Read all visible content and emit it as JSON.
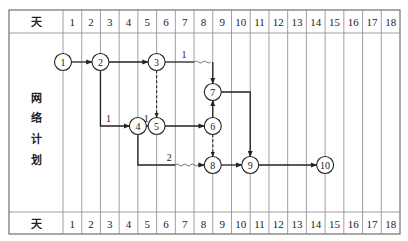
{
  "diagram": {
    "type": "time-scaled-network-plan",
    "header_label": "天",
    "footer_label": "天",
    "side_label_chars": [
      "网",
      "络",
      "计",
      "划"
    ],
    "days": [
      "1",
      "2",
      "3",
      "4",
      "5",
      "6",
      "7",
      "8",
      "9",
      "10",
      "11",
      "12",
      "13",
      "14",
      "15",
      "16",
      "17",
      "18"
    ],
    "nodes": [
      {
        "id": "1",
        "label": "1",
        "day": 0,
        "row": 0
      },
      {
        "id": "2",
        "label": "2",
        "day": 2,
        "row": 0
      },
      {
        "id": "3",
        "label": "3",
        "day": 5,
        "row": 0
      },
      {
        "id": "7",
        "label": "7",
        "day": 8,
        "row": 1
      },
      {
        "id": "4",
        "label": "4",
        "day": 4,
        "row": 2
      },
      {
        "id": "5",
        "label": "5",
        "day": 5,
        "row": 2
      },
      {
        "id": "6",
        "label": "6",
        "day": 8,
        "row": 2
      },
      {
        "id": "8",
        "label": "8",
        "day": 8,
        "row": 3
      },
      {
        "id": "9",
        "label": "9",
        "day": 10,
        "row": 3
      },
      {
        "id": "10",
        "label": "10",
        "day": 14,
        "row": 3
      }
    ],
    "edges": [
      {
        "from": "1",
        "to": "2",
        "kind": "work"
      },
      {
        "from": "2",
        "to": "3",
        "kind": "work"
      },
      {
        "from": "3",
        "to": "7",
        "kind": "work",
        "free_float_label": "1"
      },
      {
        "from": "2",
        "to": "4",
        "kind": "work",
        "free_float_label": "1"
      },
      {
        "from": "3",
        "to": "5",
        "kind": "dummy"
      },
      {
        "from": "4",
        "to": "5",
        "kind": "work",
        "free_float_label": "1"
      },
      {
        "from": "5",
        "to": "6",
        "kind": "work"
      },
      {
        "from": "6",
        "to": "7",
        "kind": "work"
      },
      {
        "from": "6",
        "to": "8",
        "kind": "dummy"
      },
      {
        "from": "4",
        "to": "8",
        "kind": "work",
        "free_float_label": "2"
      },
      {
        "from": "7",
        "to": "9",
        "kind": "work"
      },
      {
        "from": "8",
        "to": "9",
        "kind": "work"
      },
      {
        "from": "9",
        "to": "10",
        "kind": "work"
      }
    ]
  }
}
